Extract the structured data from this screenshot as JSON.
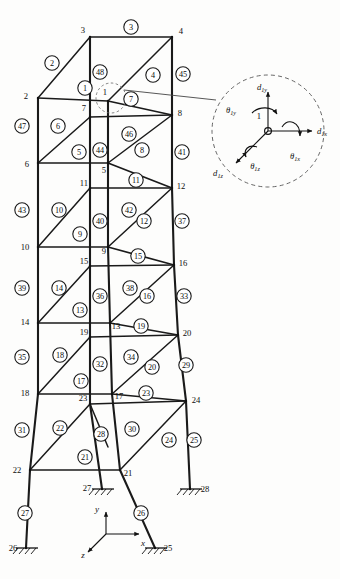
{
  "figure": {
    "kind": "space-frame-tower-diagram"
  },
  "geometry": {
    "view_box": "0 0 340 579",
    "front_left_x": 38,
    "front_right_x": 108,
    "back_left_x": 68,
    "back_right_x": 172,
    "levels_y": [
      32,
      98,
      156,
      213,
      268,
      322,
      383,
      470
    ],
    "back_offset_y": -22
  },
  "nodes": [
    {
      "id": "1",
      "x": 108,
      "y": 101,
      "lx": 105,
      "ly": 92
    },
    {
      "id": "2",
      "x": 38,
      "y": 98,
      "lx": 26,
      "ly": 96
    },
    {
      "id": "3",
      "x": 90,
      "y": 37,
      "lx": 83,
      "ly": 30
    },
    {
      "id": "4",
      "x": 172,
      "y": 37,
      "lx": 181,
      "ly": 31
    },
    {
      "id": "5",
      "x": 108,
      "y": 163,
      "lx": 104,
      "ly": 170
    },
    {
      "id": "6",
      "x": 38,
      "y": 163,
      "lx": 27,
      "ly": 164
    },
    {
      "id": "7",
      "x": 90,
      "y": 117,
      "lx": 84,
      "ly": 108
    },
    {
      "id": "8",
      "x": 172,
      "y": 115,
      "lx": 180,
      "ly": 113
    },
    {
      "id": "9",
      "x": 108,
      "y": 247,
      "lx": 104,
      "ly": 251
    },
    {
      "id": "10",
      "x": 38,
      "y": 247,
      "lx": 25,
      "ly": 247
    },
    {
      "id": "11",
      "x": 90,
      "y": 188,
      "lx": 84,
      "ly": 183
    },
    {
      "id": "12",
      "x": 172,
      "y": 188,
      "lx": 181,
      "ly": 186
    },
    {
      "id": "13",
      "x": 110,
      "y": 323,
      "lx": 116,
      "ly": 326
    },
    {
      "id": "14",
      "x": 38,
      "y": 323,
      "lx": 25,
      "ly": 322
    },
    {
      "id": "15",
      "x": 90,
      "y": 266,
      "lx": 84,
      "ly": 261
    },
    {
      "id": "16",
      "x": 174,
      "y": 265,
      "lx": 183,
      "ly": 263
    },
    {
      "id": "17",
      "x": 112,
      "y": 394,
      "lx": 119,
      "ly": 396
    },
    {
      "id": "18",
      "x": 38,
      "y": 394,
      "lx": 25,
      "ly": 393
    },
    {
      "id": "19",
      "x": 90,
      "y": 337,
      "lx": 84,
      "ly": 332
    },
    {
      "id": "20",
      "x": 178,
      "y": 335,
      "lx": 187,
      "ly": 333
    },
    {
      "id": "21",
      "x": 120,
      "y": 470,
      "lx": 128,
      "ly": 473
    },
    {
      "id": "22",
      "x": 30,
      "y": 470,
      "lx": 17,
      "ly": 470
    },
    {
      "id": "23",
      "x": 90,
      "y": 404,
      "lx": 83,
      "ly": 398
    },
    {
      "id": "24",
      "x": 186,
      "y": 401,
      "lx": 196,
      "ly": 400
    },
    {
      "id": "25",
      "x": 155,
      "y": 548,
      "lx": 168,
      "ly": 548
    },
    {
      "id": "26",
      "x": 26,
      "y": 548,
      "lx": 13,
      "ly": 548
    },
    {
      "id": "27",
      "x": 102,
      "y": 489,
      "lx": 87,
      "ly": 488
    },
    {
      "id": "28",
      "x": 190,
      "y": 489,
      "lx": 205,
      "ly": 489
    }
  ],
  "members": [
    {
      "id": "1",
      "x": 85,
      "y": 88,
      "kind": "front-left-top-diagonal"
    },
    {
      "id": "2",
      "x": 52,
      "y": 63,
      "kind": "front-left-roof-rake"
    },
    {
      "id": "3",
      "x": 131,
      "y": 27,
      "kind": "roof-back-beam"
    },
    {
      "id": "4",
      "x": 153,
      "y": 75,
      "kind": "back-right-roof-diagonal"
    },
    {
      "id": "5",
      "x": 79,
      "y": 152,
      "kind": "left-bay-beam"
    },
    {
      "id": "6",
      "x": 58,
      "y": 126,
      "kind": "left-bay-diagonal"
    },
    {
      "id": "7",
      "x": 131,
      "y": 99,
      "kind": "front-right-top-beam"
    },
    {
      "id": "8",
      "x": 142,
      "y": 150,
      "kind": "right-bay-diagonal"
    },
    {
      "id": "9",
      "x": 80,
      "y": 234,
      "kind": "left-bay-beam"
    },
    {
      "id": "10",
      "x": 59,
      "y": 210,
      "kind": "left-bay-diagonal"
    },
    {
      "id": "11",
      "x": 136,
      "y": 180,
      "kind": "right-bay-beam"
    },
    {
      "id": "12",
      "x": 144,
      "y": 221,
      "kind": "right-bay-diagonal"
    },
    {
      "id": "13",
      "x": 80,
      "y": 310,
      "kind": "left-bay-beam"
    },
    {
      "id": "14",
      "x": 59,
      "y": 288,
      "kind": "left-bay-diagonal"
    },
    {
      "id": "15",
      "x": 138,
      "y": 256,
      "kind": "right-bay-beam"
    },
    {
      "id": "16",
      "x": 147,
      "y": 296,
      "kind": "right-bay-diagonal"
    },
    {
      "id": "17",
      "x": 81,
      "y": 381,
      "kind": "left-bay-beam"
    },
    {
      "id": "18",
      "x": 60,
      "y": 355,
      "kind": "left-bay-diagonal"
    },
    {
      "id": "19",
      "x": 141,
      "y": 326,
      "kind": "right-bay-beam"
    },
    {
      "id": "20",
      "x": 152,
      "y": 367,
      "kind": "right-bay-diagonal"
    },
    {
      "id": "21",
      "x": 85,
      "y": 457,
      "kind": "base-left-beam"
    },
    {
      "id": "22",
      "x": 60,
      "y": 428,
      "kind": "base-left-diagonal"
    },
    {
      "id": "23",
      "x": 146,
      "y": 393,
      "kind": "base-right-beam"
    },
    {
      "id": "24",
      "x": 169,
      "y": 440,
      "kind": "base-right-diagonal"
    },
    {
      "id": "25",
      "x": 194,
      "y": 440,
      "kind": "right-leg-column"
    },
    {
      "id": "26",
      "x": 141,
      "y": 513,
      "kind": "front-center-leg"
    },
    {
      "id": "27",
      "x": 25,
      "y": 513,
      "kind": "left-leg-column"
    },
    {
      "id": "28",
      "x": 101,
      "y": 434,
      "kind": "back-center-column"
    },
    {
      "id": "29",
      "x": 186,
      "y": 365,
      "kind": "right-column"
    },
    {
      "id": "30",
      "x": 132,
      "y": 429,
      "kind": "back-right-diagonal"
    },
    {
      "id": "31",
      "x": 22,
      "y": 430,
      "kind": "left-column"
    },
    {
      "id": "32",
      "x": 100,
      "y": 364,
      "kind": "back-center-column"
    },
    {
      "id": "33",
      "x": 184,
      "y": 296,
      "kind": "right-column"
    },
    {
      "id": "34",
      "x": 131,
      "y": 357,
      "kind": "back-right-diagonal"
    },
    {
      "id": "35",
      "x": 22,
      "y": 357,
      "kind": "left-column"
    },
    {
      "id": "36",
      "x": 100,
      "y": 296,
      "kind": "back-center-column"
    },
    {
      "id": "37",
      "x": 182,
      "y": 221,
      "kind": "right-column"
    },
    {
      "id": "38",
      "x": 130,
      "y": 288,
      "kind": "back-right-diagonal"
    },
    {
      "id": "39",
      "x": 22,
      "y": 288,
      "kind": "left-column"
    },
    {
      "id": "40",
      "x": 100,
      "y": 221,
      "kind": "back-center-column"
    },
    {
      "id": "41",
      "x": 182,
      "y": 152,
      "kind": "right-column"
    },
    {
      "id": "42",
      "x": 129,
      "y": 210,
      "kind": "back-right-diagonal"
    },
    {
      "id": "43",
      "x": 22,
      "y": 210,
      "kind": "left-column"
    },
    {
      "id": "44",
      "x": 100,
      "y": 150,
      "kind": "back-center-column"
    },
    {
      "id": "45",
      "x": 183,
      "y": 74,
      "kind": "right-column"
    },
    {
      "id": "46",
      "x": 129,
      "y": 134,
      "kind": "back-right-diagonal"
    },
    {
      "id": "47",
      "x": 22,
      "y": 126,
      "kind": "left-column"
    },
    {
      "id": "48",
      "x": 100,
      "y": 72,
      "kind": "back-center-column"
    }
  ],
  "supports": [
    {
      "node": "26",
      "x": 26,
      "y": 548
    },
    {
      "node": "27",
      "x": 102,
      "y": 489
    },
    {
      "node": "28",
      "x": 190,
      "y": 489
    },
    {
      "node": "25",
      "x": 155,
      "y": 548
    }
  ],
  "axes": {
    "origin": {
      "x": 106,
      "y": 534
    },
    "labels": {
      "x": "x",
      "y": "y",
      "z": "z"
    },
    "x_label_pos": {
      "x": 143,
      "y": 543
    },
    "y_label_pos": {
      "x": 97,
      "y": 509
    },
    "z_label_pos": {
      "x": 83,
      "y": 555
    }
  },
  "detail": {
    "node_label": "1",
    "center": {
      "x": 268,
      "y": 131
    },
    "radius": 56,
    "callout_circle": {
      "x": 111,
      "y": 98,
      "r": 15
    },
    "dofs": [
      {
        "name": "d_1y",
        "base": "d",
        "sub": "1y",
        "x": 262,
        "y": 87,
        "type": "translation"
      },
      {
        "name": "d_1x",
        "base": "d",
        "sub": "1x",
        "x": 320,
        "y": 131,
        "type": "translation"
      },
      {
        "name": "d_1z",
        "base": "d",
        "sub": "1z",
        "x": 220,
        "y": 172,
        "type": "translation"
      },
      {
        "name": "t_1y",
        "base": "θ",
        "sub": "1y",
        "x": 232,
        "y": 110,
        "type": "rotation"
      },
      {
        "name": "t_1x",
        "base": "θ",
        "sub": "1x",
        "x": 296,
        "y": 155,
        "type": "rotation"
      },
      {
        "name": "t_1z",
        "base": "θ",
        "sub": "1z",
        "x": 256,
        "y": 165,
        "type": "rotation"
      }
    ]
  }
}
